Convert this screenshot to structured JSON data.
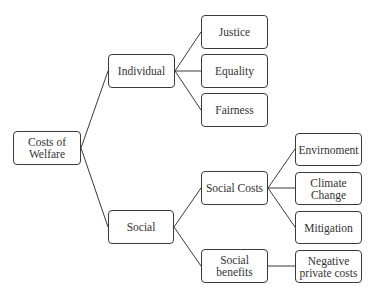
{
  "diagram": {
    "type": "tree",
    "root": "Costs of\nWelfare",
    "nodes": {
      "root": "Costs of\nWelfare",
      "individual": "Individual",
      "justice": "Justice",
      "equality": "Equality",
      "fairness": "Fairness",
      "social": "Social",
      "social_costs": "Social Costs",
      "social_benefits": "Social\nbenefits",
      "environment": "Envirnoment",
      "climate_change": "Climate\nChange",
      "mitigation": "Mitigation",
      "negative_private_costs": "Negative\nprivate costs"
    },
    "edges": [
      [
        "root",
        "individual"
      ],
      [
        "root",
        "social"
      ],
      [
        "individual",
        "justice"
      ],
      [
        "individual",
        "equality"
      ],
      [
        "individual",
        "fairness"
      ],
      [
        "social",
        "social_costs"
      ],
      [
        "social",
        "social_benefits"
      ],
      [
        "social_costs",
        "environment"
      ],
      [
        "social_costs",
        "climate_change"
      ],
      [
        "social_costs",
        "mitigation"
      ],
      [
        "social_benefits",
        "negative_private_costs"
      ]
    ],
    "colors": {
      "line": "#3a3a3a",
      "border": "#3a3a3a",
      "text": "#333333",
      "background": "#ffffff"
    }
  }
}
